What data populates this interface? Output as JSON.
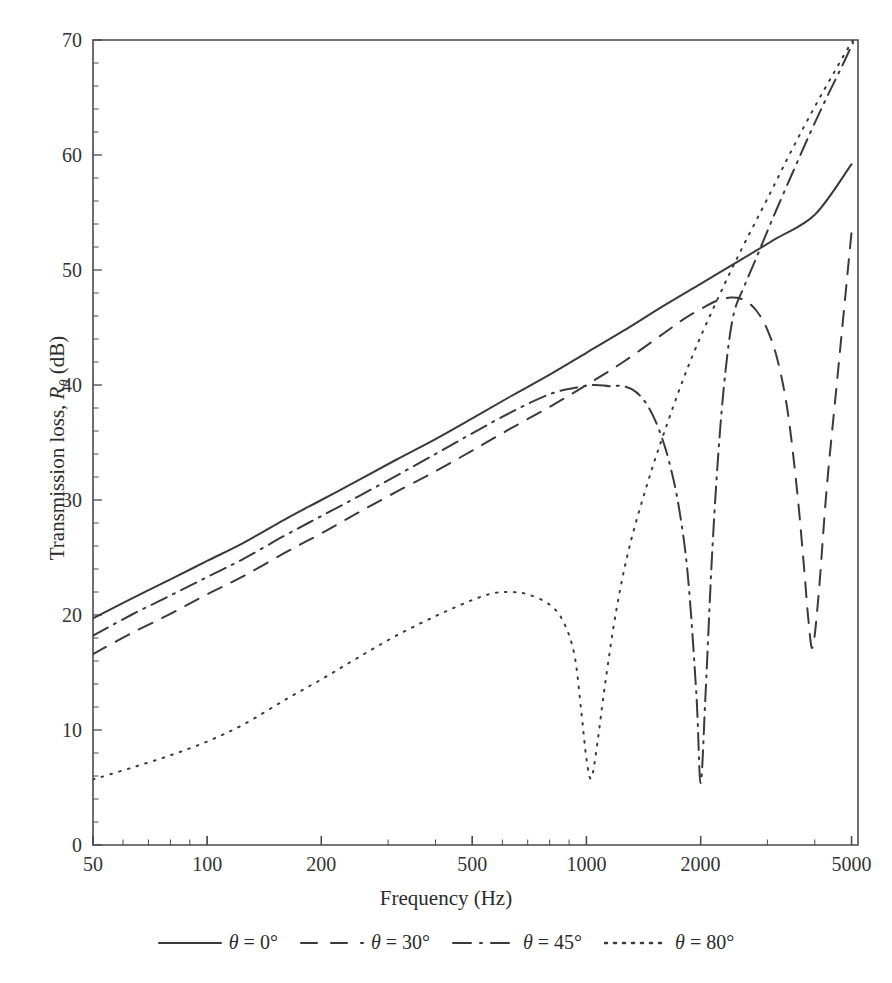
{
  "chart_data": {
    "type": "line",
    "title": "",
    "xlabel": "Frequency (Hz)",
    "ylabel": "Transmission loss, Rθ (dB)",
    "ylabel_parts": {
      "prefix": "Transmission loss, ",
      "symbol": "R",
      "subscript": "θ",
      "suffix": " (dB)"
    },
    "xscale": "log",
    "xlim": [
      50,
      5200
    ],
    "ylim": [
      0,
      70
    ],
    "xticks": [
      50,
      100,
      200,
      500,
      1000,
      2000,
      5000
    ],
    "xtick_labels": [
      "50",
      "100",
      "200",
      "500",
      "1000",
      "2000",
      "5000"
    ],
    "yticks": [
      0,
      10,
      20,
      30,
      40,
      50,
      60,
      70
    ],
    "ytick_labels": [
      "0",
      "10",
      "20",
      "30",
      "40",
      "50",
      "60",
      "70"
    ],
    "y_minor_step": 2,
    "grid": false,
    "legend_position": "below",
    "line_color": "#3a3a3a",
    "axis_color": "#4a4a4a",
    "series": [
      {
        "name": "θ = 0°",
        "label_parts": {
          "symbol": "θ",
          "text": " = 0°"
        },
        "dash": "none",
        "dasharray": "",
        "x": [
          50,
          63,
          80,
          100,
          125,
          160,
          200,
          250,
          315,
          400,
          500,
          630,
          800,
          1000,
          1250,
          1600,
          2000,
          2500,
          3150,
          4000,
          5000
        ],
        "y": [
          19.7,
          21.4,
          23.1,
          24.7,
          26.3,
          28.3,
          30.0,
          31.7,
          33.5,
          35.3,
          37.1,
          39.0,
          40.9,
          42.8,
          44.7,
          46.9,
          48.8,
          50.7,
          52.7,
          54.8,
          59.2
        ]
      },
      {
        "name": "θ = 30°",
        "label_parts": {
          "symbol": "θ",
          "text": " = 30°"
        },
        "dash": "dashed",
        "dasharray": "15 11",
        "x": [
          50,
          63,
          80,
          100,
          125,
          160,
          200,
          250,
          315,
          400,
          500,
          630,
          800,
          1000,
          1250,
          1600,
          1800,
          2000,
          2200,
          2400,
          2600,
          2800,
          3000,
          3200,
          3400,
          3600,
          3750,
          3850,
          3950,
          4100,
          4300,
          4600,
          5000
        ],
        "y": [
          16.6,
          18.4,
          20.1,
          21.8,
          23.4,
          25.4,
          27.1,
          28.9,
          30.7,
          32.5,
          34.3,
          36.2,
          38.1,
          40.0,
          42.0,
          44.5,
          45.7,
          46.6,
          47.3,
          47.6,
          47.4,
          46.5,
          44.8,
          42.0,
          37.5,
          30.5,
          24.0,
          19.5,
          17.2,
          22.0,
          31.0,
          41.0,
          53.3
        ]
      },
      {
        "name": "θ = 45°",
        "label_parts": {
          "symbol": "θ",
          "text": " = 45°"
        },
        "dash": "dashdot",
        "dasharray": "17 7 2 7",
        "x": [
          50,
          63,
          80,
          100,
          125,
          160,
          200,
          250,
          315,
          400,
          500,
          630,
          800,
          950,
          1050,
          1150,
          1250,
          1350,
          1450,
          1550,
          1650,
          1750,
          1850,
          1950,
          2000,
          2060,
          2150,
          2250,
          2350,
          2450,
          2600,
          2800,
          3100,
          3500,
          3900,
          4300,
          4700,
          5050
        ],
        "y": [
          18.2,
          20.0,
          21.7,
          23.3,
          24.9,
          26.9,
          28.6,
          30.3,
          32.1,
          34.0,
          35.8,
          37.6,
          39.2,
          39.8,
          40.0,
          39.9,
          39.9,
          39.4,
          38.2,
          36.2,
          33.4,
          29.5,
          23.5,
          13.0,
          5.4,
          13.0,
          26.0,
          36.0,
          42.5,
          46.3,
          48.5,
          51.0,
          54.5,
          58.5,
          62.0,
          65.0,
          67.6,
          69.8
        ]
      },
      {
        "name": "θ = 80°",
        "label_parts": {
          "symbol": "θ",
          "text": " = 80°"
        },
        "dash": "dotted",
        "dasharray": "1.6 7.5",
        "x": [
          50,
          63,
          80,
          100,
          125,
          160,
          200,
          250,
          315,
          400,
          500,
          570,
          630,
          700,
          800,
          870,
          930,
          970,
          1000,
          1030,
          1070,
          1120,
          1200,
          1300,
          1450,
          1600,
          1800,
          2000,
          2300,
          2600,
          3000,
          3500,
          4000,
          4500,
          5000,
          5120
        ],
        "y": [
          5.7,
          6.7,
          7.8,
          9.0,
          10.5,
          12.6,
          14.4,
          16.3,
          18.2,
          19.9,
          21.3,
          21.9,
          22.0,
          21.8,
          20.9,
          19.4,
          16.5,
          11.5,
          7.5,
          5.8,
          9.0,
          14.0,
          20.5,
          26.0,
          31.5,
          35.8,
          40.5,
          44.2,
          48.6,
          52.2,
          56.2,
          60.6,
          64.2,
          67.2,
          69.8,
          70.0
        ]
      }
    ]
  },
  "legend": {
    "items": [
      {
        "label_symbol": "θ",
        "label_text": " = 0°",
        "dash": "none"
      },
      {
        "label_symbol": "θ",
        "label_text": " = 30°",
        "dash": "dashed"
      },
      {
        "label_symbol": "θ",
        "label_text": " = 45°",
        "dash": "dashdot"
      },
      {
        "label_symbol": "θ",
        "label_text": " = 80°",
        "dash": "dotted"
      }
    ]
  }
}
